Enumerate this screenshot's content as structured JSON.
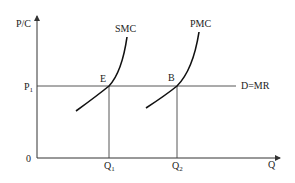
{
  "diagram": {
    "title": "",
    "axes": {
      "y_label": "P/C",
      "x_label": "Q",
      "origin_label": "0"
    },
    "price_line": {
      "label_main": "P",
      "label_sub": "1",
      "right_label": "D=MR"
    },
    "curves": [
      {
        "name": "SMC",
        "label": "SMC"
      },
      {
        "name": "PMC",
        "label": "PMC"
      }
    ],
    "points": [
      {
        "label": "E"
      },
      {
        "label": "B"
      }
    ],
    "quantities": [
      {
        "main": "Q",
        "sub": "1"
      },
      {
        "main": "Q",
        "sub": "2"
      }
    ],
    "colors": {
      "axis": "#333333",
      "curve": "#111111",
      "line": "#444444"
    }
  }
}
